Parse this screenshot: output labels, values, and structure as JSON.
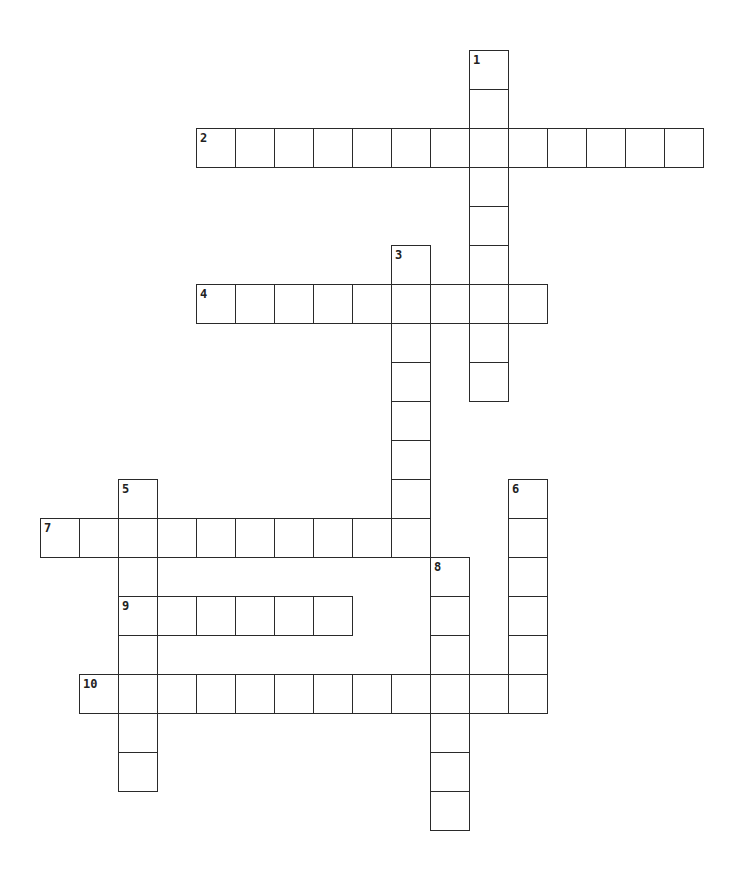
{
  "puzzle": {
    "type": "crossword",
    "grid_origin": {
      "x": 40,
      "y": 50
    },
    "cell_size": 39,
    "words": [
      {
        "number": "1",
        "direction": "down",
        "row": 0,
        "col": 11,
        "length": 9
      },
      {
        "number": "2",
        "direction": "across",
        "row": 2,
        "col": 4,
        "length": 13
      },
      {
        "number": "3",
        "direction": "down",
        "row": 5,
        "col": 9,
        "length": 8
      },
      {
        "number": "4",
        "direction": "across",
        "row": 6,
        "col": 4,
        "length": 9
      },
      {
        "number": "5",
        "direction": "down",
        "row": 11,
        "col": 2,
        "length": 8
      },
      {
        "number": "6",
        "direction": "down",
        "row": 11,
        "col": 12,
        "length": 6
      },
      {
        "number": "7",
        "direction": "across",
        "row": 12,
        "col": 0,
        "length": 10
      },
      {
        "number": "8",
        "direction": "down",
        "row": 13,
        "col": 10,
        "length": 7
      },
      {
        "number": "9",
        "direction": "across",
        "row": 14,
        "col": 2,
        "length": 6
      },
      {
        "number": "10",
        "direction": "across",
        "row": 16,
        "col": 1,
        "length": 12
      }
    ]
  }
}
